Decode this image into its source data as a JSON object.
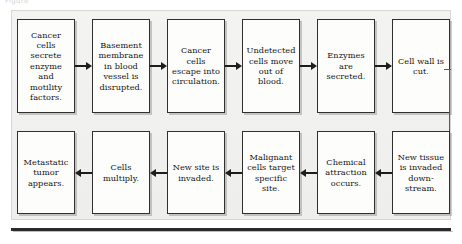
{
  "figure": {
    "caption_fragment": "Figure",
    "type": "flowchart",
    "orientation": "serpentine-two-row",
    "frame_color": "#d6d6d2",
    "frame_background": "#f1f1ef",
    "box_border_color": "#2f2f2f",
    "box_fill": "#fdfdfc",
    "arrow_color": "#1d1d1d",
    "feedback_line_color": "#5a5a5a",
    "rule_color": "#2a2a2a"
  },
  "top_row": [
    {
      "id": "step-1",
      "text": "Cancer cells secrete enzyme and motility factors."
    },
    {
      "id": "step-2",
      "text": "Basement membrane in blood vessel is disrupted."
    },
    {
      "id": "step-3",
      "text": "Cancer cells escape into circulation."
    },
    {
      "id": "step-4",
      "text": "Undetected cells move out of blood."
    },
    {
      "id": "step-5",
      "text": "Enzymes are secreted."
    },
    {
      "id": "step-6",
      "text": "Cell wall is cut."
    }
  ],
  "bottom_row": [
    {
      "id": "step-12",
      "text": "Metastatic tumor appears."
    },
    {
      "id": "step-11",
      "text": "Cells multiply."
    },
    {
      "id": "step-10",
      "text": "New site is invaded."
    },
    {
      "id": "step-9",
      "text": "Malignant cells target specific site."
    },
    {
      "id": "step-8",
      "text": "Chemical attraction occurs."
    },
    {
      "id": "step-7",
      "text": "New tissue is invaded down-stream."
    }
  ],
  "connectors": {
    "top_arrows_direction": "right",
    "bottom_arrows_direction": "left",
    "feedback": {
      "from": "step-6",
      "to": "step-7",
      "direction": "left",
      "shape": "right-down-left"
    }
  }
}
